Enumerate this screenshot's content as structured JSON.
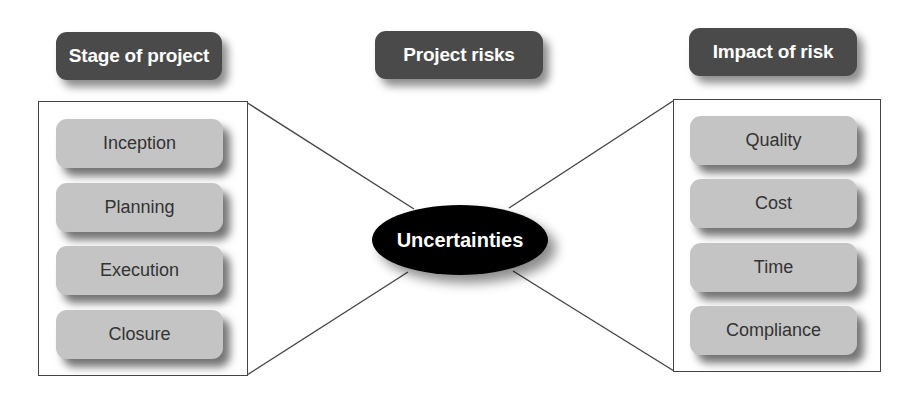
{
  "diagram": {
    "title": "Project risks",
    "center_node": "Uncertainties",
    "left_group": {
      "header": "Stage of project",
      "items": [
        "Inception",
        "Planning",
        "Execution",
        "Closure"
      ]
    },
    "right_group": {
      "header": "Impact of risk",
      "items": [
        "Quality",
        "Cost",
        "Time",
        "Compliance"
      ]
    },
    "colors": {
      "header_fill": "#4a4a4a",
      "item_fill": "#c4c4c4",
      "center_fill": "#000000",
      "line": "#444444"
    }
  }
}
